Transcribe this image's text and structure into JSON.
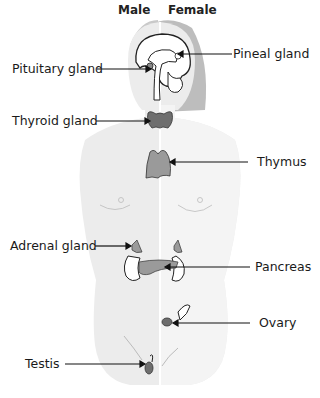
{
  "headers": {
    "male": "Male",
    "female": "Female"
  },
  "labels": {
    "pituitary": "Pituitary gland",
    "pineal": "Pineal gland",
    "thyroid": "Thyroid gland",
    "thymus": "Thymus",
    "adrenal": "Adrenal gland",
    "pancreas": "Pancreas",
    "ovary": "Ovary",
    "testis": "Testis"
  },
  "colors": {
    "body_male": "#ececec",
    "body_female": "#f3f3f3",
    "hair": "#bdbdbd",
    "gland_dark": "#6e6e6e",
    "gland_textured": "#9a9a9a",
    "outline": "#222222"
  }
}
